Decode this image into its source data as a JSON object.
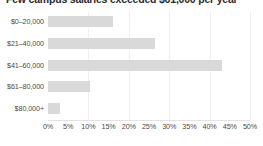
{
  "chart_data": {
    "type": "bar",
    "orientation": "horizontal",
    "title": "Few campus salaries exceeded $61,000 per year",
    "xlabel": "",
    "ylabel": "",
    "categories": [
      "$0–20,000",
      "$21–40,000",
      "$41–60,000",
      "$61–80,000",
      "$80,000+"
    ],
    "values": [
      16,
      26.5,
      43,
      10.5,
      3
    ],
    "value_unit": "%",
    "xlim": [
      0,
      50
    ],
    "xticks": [
      0,
      5,
      10,
      15,
      20,
      25,
      30,
      35,
      40,
      45,
      50
    ],
    "xtick_labels": [
      "0%",
      "5%",
      "10%",
      "15%",
      "20%",
      "25%",
      "30%",
      "35%",
      "40%",
      "45%",
      "50%"
    ],
    "gridlines": [
      10,
      20,
      30,
      40,
      50
    ],
    "grid": true,
    "legend": false,
    "bar_color": "#d9d9d9",
    "grid_color": "#f0f0f0",
    "text_color": "#4a4a4a",
    "title_color": "#2b2b2b",
    "background": "#ffffff"
  }
}
